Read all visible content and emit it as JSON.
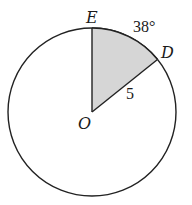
{
  "diagram": {
    "type": "circle-sector",
    "center_label": "O",
    "points": [
      {
        "label": "E",
        "position": "top of circle"
      },
      {
        "label": "D",
        "position": "on circle, upper right"
      }
    ],
    "arc_label": "38°",
    "radius_label": "5",
    "shaded_region": "sector EOD",
    "colors": {
      "stroke": "#222222",
      "sector_fill": "#d6d6d6",
      "background": "#ffffff"
    }
  }
}
